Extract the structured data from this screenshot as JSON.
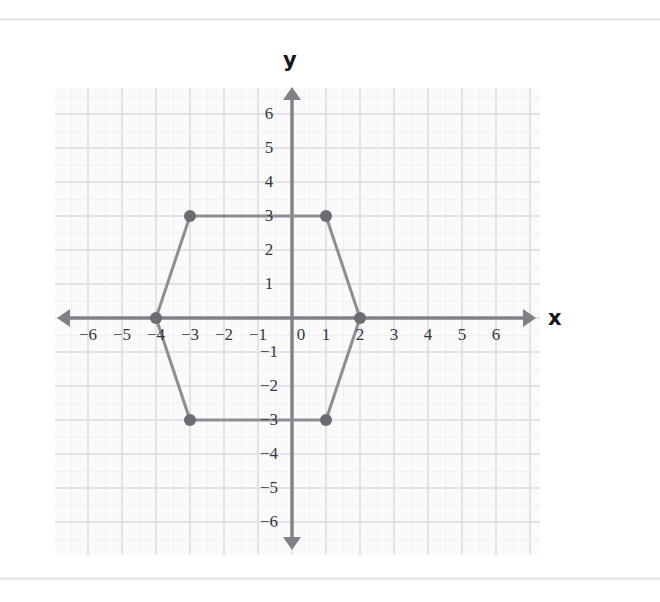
{
  "page": {
    "background_color": "#ffffff",
    "divider_color": "#dcdce1"
  },
  "axis_labels": {
    "x": "x",
    "y": "y"
  },
  "colors": {
    "axis": "#808089",
    "grid_minor": "#ededf2",
    "grid_major": "#e2e2e8",
    "grid_background": "#fafafa",
    "shape_stroke": "#8d8d95",
    "vertex_fill": "#6b6b73",
    "tick_text": "#35353b",
    "axis_label_text": "#16161a"
  },
  "chart_data": {
    "type": "scatter",
    "title": "",
    "xlabel": "x",
    "ylabel": "y",
    "xlim": [
      -6,
      6
    ],
    "ylim": [
      -6,
      6
    ],
    "grid": true,
    "legend": "none",
    "x_ticks": [
      "−6",
      "−5",
      "−4",
      "−3",
      "−2",
      "−1",
      "0",
      "1",
      "2",
      "3",
      "4",
      "5",
      "6"
    ],
    "x_tick_values": [
      -6,
      -5,
      -4,
      -3,
      -2,
      -1,
      0,
      1,
      2,
      3,
      4,
      5,
      6
    ],
    "y_ticks": [
      "6",
      "5",
      "4",
      "3",
      "2",
      "1",
      "−1",
      "−2",
      "−3",
      "−4",
      "−5",
      "−6"
    ],
    "y_tick_values": [
      6,
      5,
      4,
      3,
      2,
      1,
      -1,
      -2,
      -3,
      -4,
      -5,
      -6
    ],
    "origin_label": "0",
    "shapes": [
      {
        "name": "hexagon",
        "closed": true,
        "vertices": [
          {
            "x": -4,
            "y": 0
          },
          {
            "x": -3,
            "y": 3
          },
          {
            "x": 1,
            "y": 3
          },
          {
            "x": 2,
            "y": 0
          },
          {
            "x": 1,
            "y": -3
          },
          {
            "x": -3,
            "y": -3
          }
        ],
        "vertex_labels": [
          "(−4, 0)",
          "(−3, 3)",
          "(1, 3)",
          "(2, 0)",
          "(1, −3)",
          "(−3, −3)"
        ],
        "stroke_width": 3,
        "vertex_radius": 6
      }
    ]
  }
}
